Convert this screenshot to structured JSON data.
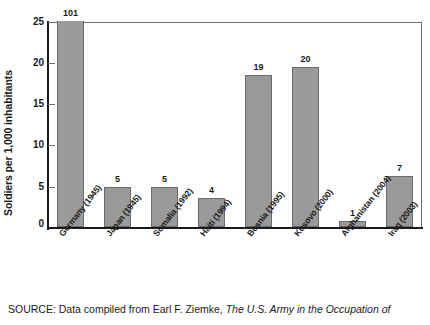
{
  "chart_data": {
    "type": "bar",
    "title": "",
    "xlabel": "",
    "ylabel": "Soldiers per 1,000 inhabitants",
    "ylim": [
      0,
      25
    ],
    "ytick_labels": [
      "0",
      "5",
      "10",
      "15",
      "20",
      "25"
    ],
    "yticks": [
      0,
      5,
      10,
      15,
      20,
      25
    ],
    "grid": false,
    "legend": "none",
    "categories": [
      "Germany (1945)",
      "Japan (1945)",
      "Somalia (1992)",
      "Haiti (1994)",
      "Bosnia (1995)",
      "Kosovo (2000)",
      "Afghanistan (2004)",
      "Iraq (2003)"
    ],
    "values": [
      101,
      5,
      5,
      4,
      19,
      20,
      1,
      7
    ],
    "plotted_values": [
      25.6,
      4.9,
      4.9,
      3.5,
      18.4,
      19.4,
      0.7,
      6.2
    ],
    "data_labels": [
      "101",
      "5",
      "5",
      "4",
      "19",
      "20",
      "1",
      "7"
    ],
    "bar_color": "#9a9a9a",
    "bar_edge_color": "#6a6a6a",
    "axis_color": "#1a1a1a"
  },
  "source": {
    "label": "SOURCE:",
    "text": " Data compiled from Earl F. Ziemke, ",
    "italic": "The U.S. Army in the Occupation of"
  }
}
